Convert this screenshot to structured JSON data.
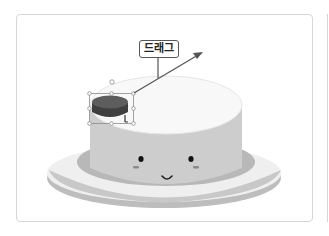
{
  "canvas": {
    "drag_label": "드래그",
    "selected_object": "cake-topping",
    "colors": {
      "plate": "#ededed",
      "plate_rim": "#c4c4c4",
      "plate_shadow": "#b9b9b9",
      "cake_side": "#cccccc",
      "cake_top": "#f7f7f7",
      "topping": "#4a4a4a",
      "topping_top": "#5c5c5c",
      "arrow": "#555555",
      "selection": "#888888"
    },
    "face": {
      "eyes": 2,
      "blush": 2,
      "mouth": "smile"
    }
  }
}
